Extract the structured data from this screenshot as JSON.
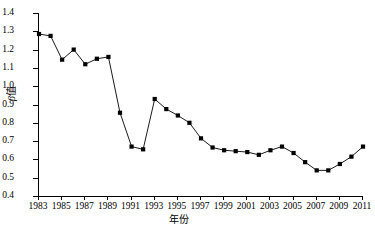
{
  "top_bleed": {
    "text": "······························································"
  },
  "style": {
    "line_color": "#000000",
    "marker_color": "#000000",
    "axis_color": "#000000",
    "background": "#ffffff"
  },
  "chart_data": {
    "type": "line",
    "title": "",
    "subtitle": "",
    "xlabel": "年份",
    "ylabel": "β值",
    "ylabel_symbol": "β",
    "ylabel_suffix": "值",
    "xlim": [
      1983,
      2011
    ],
    "ylim": [
      0.4,
      1.4
    ],
    "grid": false,
    "legend": null,
    "legend_position": "none",
    "marker": "square",
    "y_ticks": [
      0.4,
      0.5,
      0.6,
      0.7,
      0.8,
      0.9,
      1.0,
      1.1,
      1.2,
      1.3,
      1.4
    ],
    "y_tick_labels": [
      "0.4",
      "0.5",
      "0.6",
      "0.7",
      "0.8",
      "0.9",
      "1.0",
      "1.1",
      "1.2",
      "1.3",
      "1.4"
    ],
    "x_ticks": [
      1983,
      1985,
      1987,
      1989,
      1991,
      1993,
      1995,
      1997,
      1999,
      2001,
      2003,
      2005,
      2007,
      2009,
      2011
    ],
    "x_tick_labels": [
      "1983",
      "1985",
      "1987",
      "1989",
      "1991",
      "1993",
      "1995",
      "1997",
      "1999",
      "2001",
      "2003",
      "2005",
      "2007",
      "2009",
      "2011"
    ],
    "x": [
      1983,
      1984,
      1985,
      1986,
      1987,
      1988,
      1989,
      1990,
      1991,
      1992,
      1993,
      1994,
      1995,
      1996,
      1997,
      1998,
      1999,
      2000,
      2001,
      2002,
      2003,
      2004,
      2005,
      2006,
      2007,
      2008,
      2009,
      2010,
      2011
    ],
    "values": [
      1.285,
      1.275,
      1.145,
      1.2,
      1.12,
      1.15,
      1.16,
      0.855,
      0.67,
      0.655,
      0.93,
      0.875,
      0.84,
      0.8,
      0.715,
      0.665,
      0.65,
      0.645,
      0.64,
      0.625,
      0.65,
      0.67,
      0.635,
      0.585,
      0.54,
      0.54,
      0.575,
      0.615,
      0.67
    ],
    "series": [
      {
        "name": "β值",
        "values": [
          1.285,
          1.275,
          1.145,
          1.2,
          1.12,
          1.15,
          1.16,
          0.855,
          0.67,
          0.655,
          0.93,
          0.875,
          0.84,
          0.8,
          0.715,
          0.665,
          0.65,
          0.645,
          0.64,
          0.625,
          0.65,
          0.67,
          0.635,
          0.585,
          0.54,
          0.54,
          0.575,
          0.615,
          0.67
        ]
      }
    ]
  }
}
